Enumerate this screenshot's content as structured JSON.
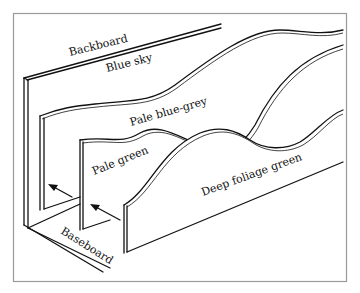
{
  "diagram": {
    "type": "layered scenery backdrop illustration",
    "labels": {
      "backboard": "Backboard",
      "blue_sky": "Blue sky",
      "pale_blue_grey": "Pale blue-grey",
      "pale_green": "Pale green",
      "deep_foliage_green": "Deep foliage green",
      "baseboard": "Baseboard"
    },
    "arrows": [
      {
        "from": "deep-foliage-green-panel",
        "to": "pale-green-panel"
      },
      {
        "from": "pale-green-panel",
        "to": "pale-blue-grey-panel"
      }
    ],
    "colors": {
      "line": "#111111",
      "background": "#ffffff",
      "frame": "#999999"
    }
  }
}
